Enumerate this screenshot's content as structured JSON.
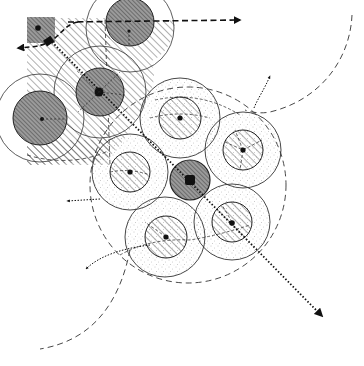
{
  "diagram": {
    "colors": {
      "ink": "#111111",
      "hatch": "#3a3a3a",
      "dark_fill": "#8a8a8a",
      "stipple": "#9a9a9a",
      "background": "#ffffff"
    },
    "legend_text": "",
    "clusters": [
      {
        "name": "origin-cluster",
        "pattern": "hatched",
        "nodes": [
          {
            "id": "origin-square",
            "shape": "square",
            "role": "origin"
          },
          {
            "id": "top-node",
            "shape": "circle",
            "role": "satellite"
          },
          {
            "id": "main-node",
            "shape": "circle",
            "role": "center"
          },
          {
            "id": "left-node",
            "shape": "circle",
            "role": "satellite"
          }
        ]
      },
      {
        "name": "growth-cluster",
        "pattern": "stippled",
        "nodes": [
          {
            "id": "core-node",
            "shape": "circle",
            "role": "center"
          },
          {
            "id": "north-node",
            "shape": "circle",
            "role": "satellite"
          },
          {
            "id": "east-node",
            "shape": "circle",
            "role": "satellite"
          },
          {
            "id": "west-node",
            "shape": "circle",
            "role": "satellite"
          },
          {
            "id": "southeast-node",
            "shape": "circle",
            "role": "satellite"
          },
          {
            "id": "south-node",
            "shape": "circle",
            "role": "satellite"
          }
        ]
      }
    ],
    "arrows": [
      {
        "id": "east-arrow",
        "style": "dashed",
        "direction": "east"
      },
      {
        "id": "west-arrow",
        "style": "dashed",
        "direction": "west"
      },
      {
        "id": "main-axis-arrow",
        "style": "dotted",
        "direction": "southeast"
      },
      {
        "id": "north-branch-arrow",
        "style": "dotted",
        "direction": "north"
      },
      {
        "id": "west-branch-arrow",
        "style": "dotted",
        "direction": "west"
      },
      {
        "id": "southwest-branch-arrow",
        "style": "dotted",
        "direction": "southwest"
      }
    ]
  }
}
